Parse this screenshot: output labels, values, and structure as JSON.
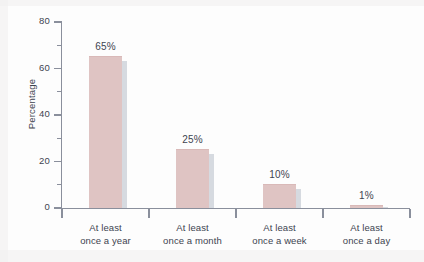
{
  "chart_data": {
    "type": "bar",
    "title": "",
    "subtitle": "",
    "xlabel": "",
    "ylabel": "Percentage",
    "ylim": [
      0,
      80
    ],
    "y_ticks_major": [
      0,
      20,
      40,
      60,
      80
    ],
    "y_tick_labels": [
      "0",
      "20",
      "40",
      "60",
      "80"
    ],
    "y_ticks_minor": [
      10,
      30,
      50,
      70
    ],
    "grid": false,
    "legend": null,
    "categories": [
      "At least once a year",
      "At least once a month",
      "At least once a week",
      "At least once a day"
    ],
    "category_lines": [
      [
        "At least",
        "once a year"
      ],
      [
        "At least",
        "once a month"
      ],
      [
        "At least",
        "once a week"
      ],
      [
        "At least",
        "once a day"
      ]
    ],
    "values": [
      65,
      25,
      10,
      1
    ],
    "data_labels": [
      "65%",
      "25%",
      "10%",
      "1%"
    ],
    "colors": {
      "bar_fill": "#dfc4c3",
      "bar_shadow": "#d6dae0",
      "axis": "#8a8f9c",
      "text": "#3d4450",
      "background": "#fdfdfd"
    }
  }
}
